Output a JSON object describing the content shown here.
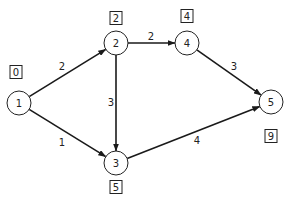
{
  "diagram": {
    "type": "directed-weighted-graph",
    "nodes": [
      {
        "id": "1",
        "label": "1",
        "x": 19,
        "y": 103,
        "earliest_time": "0",
        "box_x": 16,
        "box_y": 72
      },
      {
        "id": "2",
        "label": "2",
        "x": 116,
        "y": 43,
        "earliest_time": "2",
        "box_x": 116,
        "box_y": 18
      },
      {
        "id": "3",
        "label": "3",
        "x": 116,
        "y": 163,
        "earliest_time": "5",
        "box_x": 116,
        "box_y": 187
      },
      {
        "id": "4",
        "label": "4",
        "x": 187,
        "y": 43,
        "earliest_time": "4",
        "box_x": 187,
        "box_y": 16
      },
      {
        "id": "5",
        "label": "5",
        "x": 271,
        "y": 102,
        "earliest_time": "9",
        "box_x": 271,
        "box_y": 136
      }
    ],
    "edges": [
      {
        "from": "1",
        "to": "2",
        "weight": "2",
        "lx": 62,
        "ly": 66
      },
      {
        "from": "1",
        "to": "3",
        "weight": "1",
        "lx": 62,
        "ly": 142
      },
      {
        "from": "2",
        "to": "4",
        "weight": "2",
        "lx": 151,
        "ly": 36
      },
      {
        "from": "2",
        "to": "3",
        "weight": "3",
        "lx": 111,
        "ly": 102
      },
      {
        "from": "4",
        "to": "5",
        "weight": "3",
        "lx": 234,
        "ly": 66
      },
      {
        "from": "3",
        "to": "5",
        "weight": "4",
        "lx": 197,
        "ly": 140
      }
    ]
  }
}
